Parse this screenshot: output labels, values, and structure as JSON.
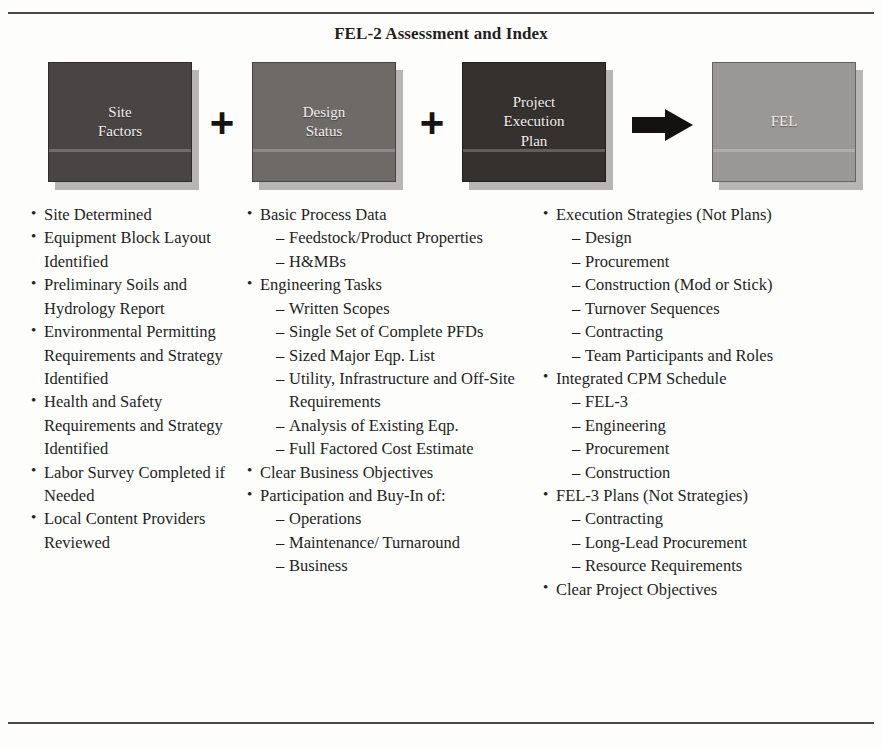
{
  "figure": {
    "title": "FEL-2 Assessment and Index"
  },
  "diagram": {
    "operators": {
      "plus": "+",
      "arrow": "arrow-right"
    },
    "nodes": [
      {
        "id": "site-factors",
        "label": "Site\nFactors",
        "color": "#484544"
      },
      {
        "id": "design-status",
        "label": "Design\nStatus",
        "color": "#6d6a68"
      },
      {
        "id": "project-execution-plan",
        "label": "Project\nExecution\nPlan",
        "color": "#34312f"
      },
      {
        "id": "fel",
        "label": "FEL",
        "color": "#9a9896"
      }
    ]
  },
  "columns": [
    {
      "id": "site-factors-list",
      "items": [
        {
          "text": "Site Determined"
        },
        {
          "text": "Equipment Block Layout Identified"
        },
        {
          "text": "Preliminary Soils and Hydrology Report"
        },
        {
          "text": "Environmental Permitting Requirements and Strategy Identified"
        },
        {
          "text": "Health and Safety Requirements and Strategy Identified"
        },
        {
          "text": "Labor Survey Completed if Needed"
        },
        {
          "text": "Local Content Providers Reviewed"
        }
      ]
    },
    {
      "id": "design-status-list",
      "items": [
        {
          "text": "Basic Process Data",
          "sub": [
            "Feedstock/Product Properties",
            "H&MBs"
          ]
        },
        {
          "text": "Engineering Tasks",
          "sub": [
            "Written Scopes",
            "Single Set of Complete PFDs",
            "Sized Major Eqp. List",
            "Utility, Infrastructure and Off-Site Requirements",
            "Analysis of Existing Eqp.",
            "Full Factored Cost Estimate"
          ]
        },
        {
          "text": "Clear Business Objectives"
        },
        {
          "text": "Participation and Buy-In of:",
          "sub": [
            "Operations",
            "Maintenance/ Turnaround",
            "Business"
          ]
        }
      ]
    },
    {
      "id": "project-execution-plan-list",
      "items": [
        {
          "text": "Execution Strategies (Not Plans)",
          "sub": [
            "Design",
            "Procurement",
            "Construction (Mod or Stick)",
            "Turnover Sequences",
            "Contracting",
            "Team Participants and Roles"
          ]
        },
        {
          "text": "Integrated CPM Schedule",
          "sub": [
            "FEL-3",
            "Engineering",
            "Procurement",
            "Construction"
          ]
        },
        {
          "text": "FEL-3 Plans (Not Strategies)",
          "sub": [
            "Contracting",
            "Long-Lead Procurement",
            "Resource Requirements"
          ]
        },
        {
          "text": "Clear Project Objectives"
        }
      ]
    }
  ]
}
